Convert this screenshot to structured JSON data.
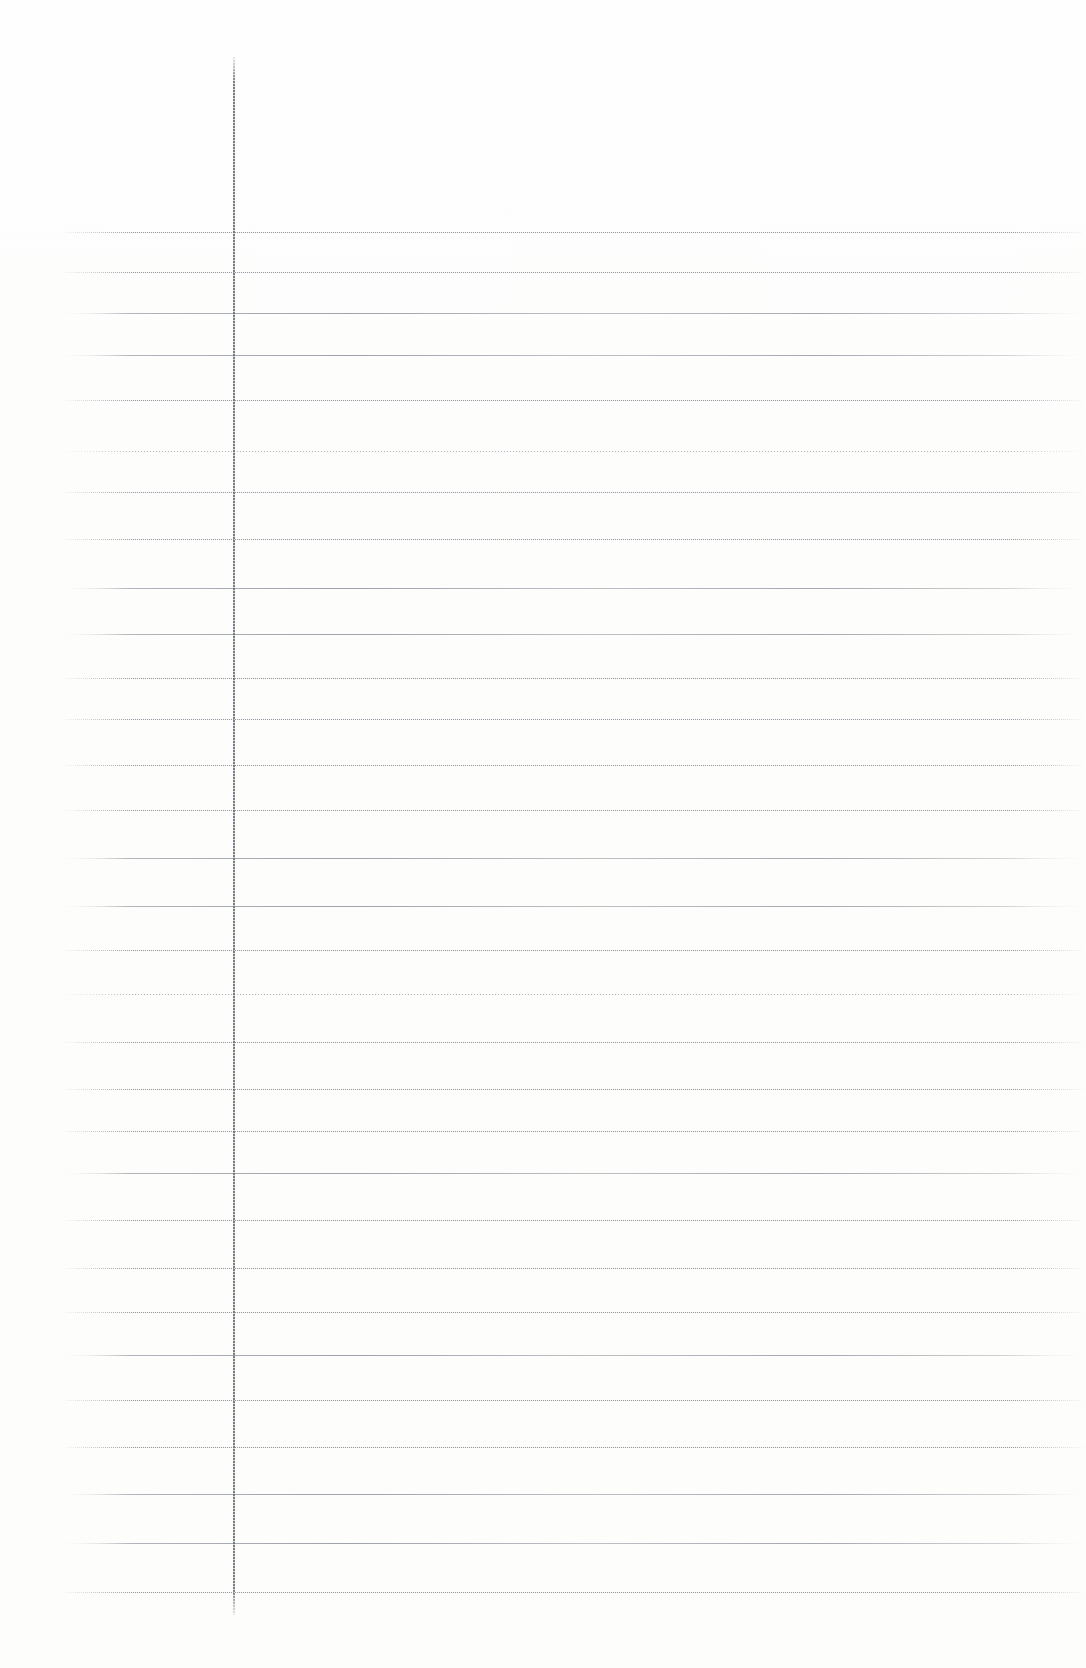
{
  "document": {
    "kind": "scanned-ruled-notebook-page",
    "orientation": "portrait",
    "page_width_px": 1086,
    "page_height_px": 1668,
    "visible_text": "",
    "handwriting_present": "no",
    "printed_text_present": "no",
    "description": "Blank scanned page of ruled notebook paper with a single vertical margin rule and 30 faint horizontal ruled lines."
  },
  "colors": {
    "paper_background": "#fdfdfc",
    "page_edge_tint": "#f2f2f0",
    "rule_line": "#9aa0a8",
    "rule_line_light": "#c2c5cb",
    "margin_rule": "#6e727a"
  },
  "margin_rule": {
    "name": "vertical-margin-line",
    "x_px": 233,
    "top_px": 57,
    "bottom_px": 1615,
    "width_px": 2,
    "style": "dotted-stippled"
  },
  "ruling": {
    "line_start_x_px": 63,
    "line_end_x_px": 1082,
    "first_line_y_px": 232,
    "last_line_y_px": 1592,
    "average_spacing_px": 47,
    "line_count": 30,
    "lines": [
      {
        "y": 232,
        "style": "style-dotted"
      },
      {
        "y": 272,
        "style": "style-dotted"
      },
      {
        "y": 313,
        "style": "style-solid"
      },
      {
        "y": 355,
        "style": "style-solid"
      },
      {
        "y": 400,
        "style": "style-dotted"
      },
      {
        "y": 451,
        "style": "style-faded"
      },
      {
        "y": 492,
        "style": "style-dotted"
      },
      {
        "y": 539,
        "style": "style-dotted"
      },
      {
        "y": 588,
        "style": "style-solid"
      },
      {
        "y": 634,
        "style": "style-solid"
      },
      {
        "y": 678,
        "style": "style-dotted"
      },
      {
        "y": 719,
        "style": "style-dotted"
      },
      {
        "y": 765,
        "style": "style-dotted"
      },
      {
        "y": 810,
        "style": "style-dotted"
      },
      {
        "y": 858,
        "style": "style-solid"
      },
      {
        "y": 906,
        "style": "style-solid"
      },
      {
        "y": 950,
        "style": "style-dotted"
      },
      {
        "y": 994,
        "style": "style-faded"
      },
      {
        "y": 1042,
        "style": "style-dotted"
      },
      {
        "y": 1089,
        "style": "style-dotted"
      },
      {
        "y": 1131,
        "style": "style-dotted"
      },
      {
        "y": 1173,
        "style": "style-solid"
      },
      {
        "y": 1220,
        "style": "style-dotted"
      },
      {
        "y": 1268,
        "style": "style-dotted"
      },
      {
        "y": 1312,
        "style": "style-dotted"
      },
      {
        "y": 1355,
        "style": "style-solid"
      },
      {
        "y": 1400,
        "style": "style-dotted"
      },
      {
        "y": 1447,
        "style": "style-dotted"
      },
      {
        "y": 1494,
        "style": "style-solid"
      },
      {
        "y": 1543,
        "style": "style-solid"
      },
      {
        "y": 1592,
        "style": "style-dotted"
      }
    ]
  },
  "regions": {
    "header_area": {
      "name": "unruled-header-area",
      "top_px": 0,
      "height_px": 232
    },
    "left_margin_column": {
      "name": "left-margin-column",
      "left_px": 0,
      "width_px": 233
    },
    "writing_area": {
      "name": "writing-area",
      "left_px": 233,
      "top_px": 232,
      "width_px": 853,
      "height_px": 1383
    },
    "footer_area": {
      "name": "unruled-footer-area",
      "top_px": 1592,
      "height_px": 76
    }
  }
}
